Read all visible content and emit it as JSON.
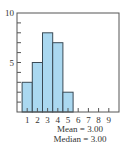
{
  "chart_data": {
    "type": "bar",
    "title": "",
    "xlabel": "",
    "ylabel": "",
    "categories": [
      "1",
      "2",
      "3",
      "4",
      "5",
      "6",
      "7",
      "8",
      "9"
    ],
    "values": [
      3,
      5,
      8,
      7,
      2,
      0,
      0,
      0,
      0
    ],
    "ylim": [
      0,
      10
    ],
    "xlim": [
      0,
      10
    ],
    "y_tick_labels": [
      "5",
      "10"
    ],
    "y_minor_ticks_every": 1,
    "x_tick_labels": [
      "1",
      "2",
      "3",
      "4",
      "5",
      "6",
      "7",
      "8",
      "9"
    ],
    "grid": false,
    "legend": null,
    "bar_color": "#aad8f0",
    "bar_edge_color": "#3a4a55",
    "annotations": [
      "Mean = 3.00",
      "Median = 3.00"
    ]
  },
  "stats": {
    "mean_label": "Mean = 3.00",
    "median_label": "Median = 3.00"
  }
}
